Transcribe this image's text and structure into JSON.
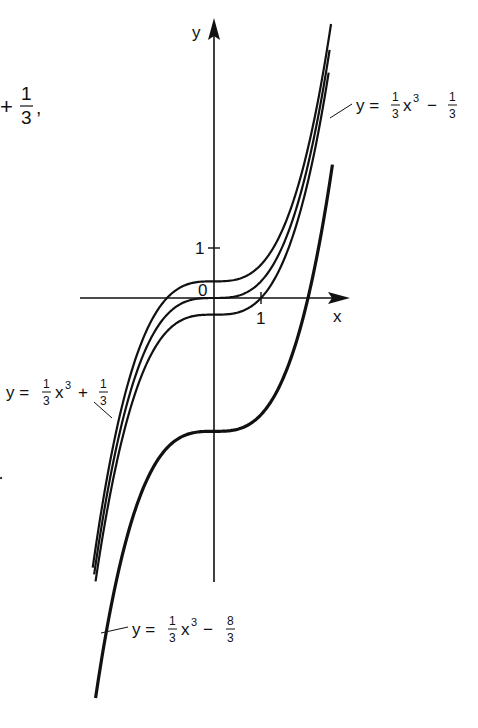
{
  "figure": {
    "axes": {
      "x_label": "x",
      "y_label": "y",
      "origin_label": "0",
      "x_tick_label": "1",
      "y_tick_label": "1"
    },
    "fragment_top_left": {
      "op": "+",
      "num": "1",
      "den": "3",
      "trail": ","
    },
    "curves": [
      {
        "id": "plus-one-third",
        "c": 0.3333,
        "style": "thin",
        "x_range": [
          -2.58,
          2.49
        ],
        "label": {
          "lhs": "y =",
          "num": "1",
          "den": "3",
          "var": "x",
          "exp": "3",
          "op": "+",
          "cnum": "1",
          "cden": "3"
        }
      },
      {
        "id": "zero",
        "c": 0,
        "style": "thin",
        "x_range": [
          -2.55,
          2.46
        ],
        "label": null
      },
      {
        "id": "minus-one-third",
        "c": -0.3333,
        "style": "thin",
        "x_range": [
          -2.52,
          2.44
        ],
        "label": {
          "lhs": "y =",
          "num": "1",
          "den": "3",
          "var": "x",
          "exp": "3",
          "op": "−",
          "cnum": "1",
          "cden": "3"
        }
      },
      {
        "id": "minus-eight-thirds",
        "c": -2.6667,
        "style": "bold",
        "x_range": [
          -2.52,
          2.52
        ],
        "label": {
          "lhs": "y =",
          "num": "1",
          "den": "3",
          "var": "x",
          "exp": "3",
          "op": "−",
          "cnum": "8",
          "cden": "3"
        }
      }
    ],
    "function_family": "y = (1/3)x^3 + c"
  }
}
